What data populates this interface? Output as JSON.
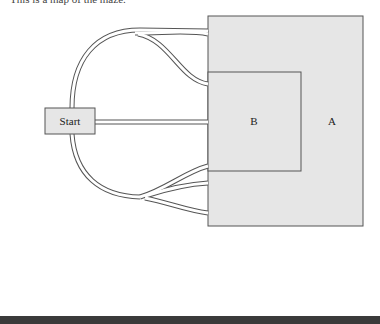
{
  "caption": "This is a map of the maze.",
  "diagram": {
    "start_label": "Start",
    "region_a_label": "A",
    "region_b_label": "B",
    "colors": {
      "region_fill": "#e6e6e6",
      "stroke": "#555555",
      "path_fill": "#ffffff",
      "bottom_bar": "#3a3a3a"
    }
  }
}
